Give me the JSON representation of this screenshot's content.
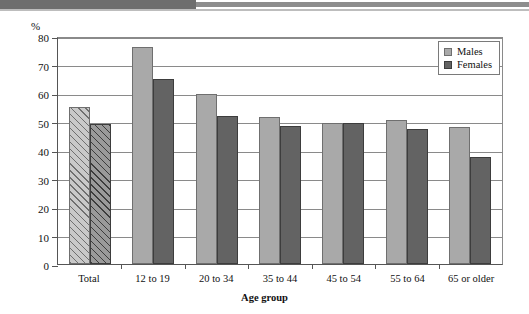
{
  "banner": {
    "present": true,
    "dark_color": "#6e6e6e",
    "line_color": "#8d8d8d"
  },
  "axis": {
    "y_unit": "%",
    "y_ticks": [
      0,
      10,
      20,
      30,
      40,
      50,
      60,
      70,
      80
    ],
    "x_title": "Age group"
  },
  "legend": {
    "entries": [
      {
        "label": "Males",
        "color": "#a9a9a9"
      },
      {
        "label": "Females",
        "color": "#636363"
      }
    ]
  },
  "chart_data": {
    "type": "bar",
    "title": "",
    "xlabel": "Age group",
    "ylabel": "%",
    "ylim": [
      0,
      80
    ],
    "ytick_step": 10,
    "grid": true,
    "legend_position": "top-right",
    "categories": [
      "Total",
      "12 to 19",
      "20 to 34",
      "35 to 44",
      "45 to 54",
      "55 to 64",
      "65 or older"
    ],
    "series": [
      {
        "name": "Males",
        "color": "#a9a9a9",
        "values": [
          55,
          76,
          59.5,
          51.5,
          49.5,
          50.5,
          48
        ]
      },
      {
        "name": "Females",
        "color": "#636363",
        "values": [
          49,
          65,
          52,
          48.5,
          49.5,
          47.5,
          37.5
        ]
      }
    ],
    "hatched_categories": [
      "Total"
    ],
    "annotations": []
  }
}
